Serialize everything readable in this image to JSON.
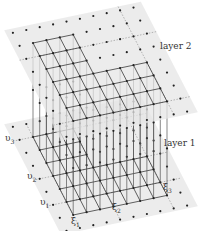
{
  "figure": {
    "type": "two-layer lattice diagram",
    "layers": [
      {
        "id": "layer2",
        "label": "layer 2",
        "position": "top"
      },
      {
        "id": "layer1",
        "label": "layer 1",
        "position": "bottom"
      }
    ],
    "axis_labels": {
      "left": [
        "υ3",
        "υ2",
        "υ1"
      ],
      "bottom": [
        "ξ1",
        "ξ2",
        "ξ3"
      ]
    },
    "colors": {
      "plane": "#e6e6e6",
      "grid_line": "#3a3a3a",
      "vertical_line": "#555555",
      "dot": "#222222",
      "dashed": "#888888"
    }
  },
  "labels": {
    "layer2": "layer 2",
    "layer1": "layer 1",
    "u3": "υ",
    "u3_sub": "3",
    "u2": "υ",
    "u2_sub": "2",
    "u1": "υ",
    "u1_sub": "1",
    "x1": "ξ",
    "x1_sub": "1",
    "x2": "ξ",
    "x2_sub": "2",
    "x3": "ξ",
    "x3_sub": "3"
  }
}
